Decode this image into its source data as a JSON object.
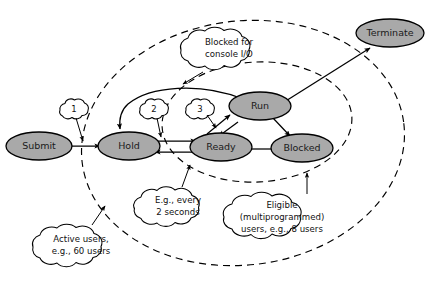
{
  "figure": {
    "type": "state-transition-diagram",
    "background_color": "#ffffff",
    "node_fill_color": "#a9a9a9",
    "node_stroke_color": "#000000",
    "line_color": "#000000"
  },
  "states": [
    {
      "id": "submit",
      "label": "Submit"
    },
    {
      "id": "hold",
      "label": "Hold"
    },
    {
      "id": "ready",
      "label": "Ready"
    },
    {
      "id": "run",
      "label": "Run"
    },
    {
      "id": "blocked",
      "label": "Blocked"
    },
    {
      "id": "terminate",
      "label": "Terminate"
    }
  ],
  "markers": [
    {
      "id": "marker-1",
      "label": "1"
    },
    {
      "id": "marker-2",
      "label": "2"
    },
    {
      "id": "marker-3",
      "label": "3"
    }
  ],
  "callouts": [
    {
      "id": "blocked-console-io",
      "lines": [
        "Blocked for",
        "console I/O"
      ]
    },
    {
      "id": "active-users",
      "lines": [
        "Active users,",
        "e.g., 60 users"
      ]
    },
    {
      "id": "every-2-seconds",
      "lines": [
        "E.g., every",
        "2 seconds"
      ]
    },
    {
      "id": "eligible-users",
      "lines": [
        "Eligible",
        "(multiprogrammed)",
        "users, e.g., 8 users"
      ]
    }
  ],
  "boundaries": [
    {
      "id": "active-users-boundary",
      "style": "dashed"
    },
    {
      "id": "eligible-users-boundary",
      "style": "dashed"
    }
  ]
}
